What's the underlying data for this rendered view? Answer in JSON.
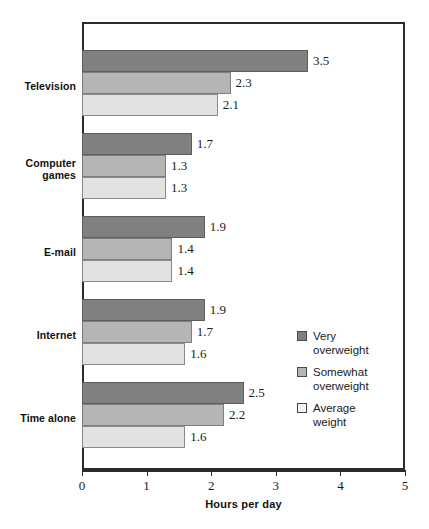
{
  "chart_data": {
    "type": "bar",
    "orientation": "horizontal",
    "title": "",
    "xlabel": "Hours per day",
    "ylabel": "",
    "xlim": [
      0,
      5
    ],
    "xticks": [
      "0",
      "1",
      "2",
      "3",
      "4",
      "5"
    ],
    "grid": false,
    "legend_position": "inside-right",
    "categories": [
      "Television",
      "Computer games",
      "E-mail",
      "Internet",
      "Time alone"
    ],
    "series": [
      {
        "name": "Very overweight",
        "color": "#808080",
        "values": [
          3.5,
          1.7,
          1.9,
          1.9,
          2.5
        ],
        "labels": [
          "3.5",
          "1.7",
          "1.9",
          "1.9",
          "2.5"
        ]
      },
      {
        "name": "Somewhat overweight",
        "color": "#b5b5b5",
        "values": [
          2.3,
          1.3,
          1.4,
          1.7,
          2.2
        ],
        "labels": [
          "2.3",
          "1.3",
          "1.4",
          "1.7",
          "2.2"
        ]
      },
      {
        "name": "Average weight",
        "color": "#e2e2e2",
        "values": [
          2.1,
          1.3,
          1.4,
          1.6,
          1.6
        ],
        "labels": [
          "2.1",
          "1.3",
          "1.4",
          "1.6",
          "1.6"
        ]
      }
    ]
  },
  "legend": {
    "items": [
      {
        "label_line1": "Very",
        "label_line2": "overweight",
        "swatch": "dark-grey-swatch"
      },
      {
        "label_line1": "Somewhat",
        "label_line2": "overweight",
        "swatch": "medium-grey-swatch"
      },
      {
        "label_line1": "Average",
        "label_line2": "weight",
        "swatch": "light-grey-swatch"
      }
    ]
  },
  "axis": {
    "title": "Hours per day",
    "ticks": [
      "0",
      "1",
      "2",
      "3",
      "4",
      "5"
    ]
  },
  "categories_display": [
    {
      "line1": "Television",
      "line2": ""
    },
    {
      "line1": "Computer",
      "line2": "games"
    },
    {
      "line1": "E-mail",
      "line2": ""
    },
    {
      "line1": "Internet",
      "line2": ""
    },
    {
      "line1": "Time alone",
      "line2": ""
    }
  ]
}
